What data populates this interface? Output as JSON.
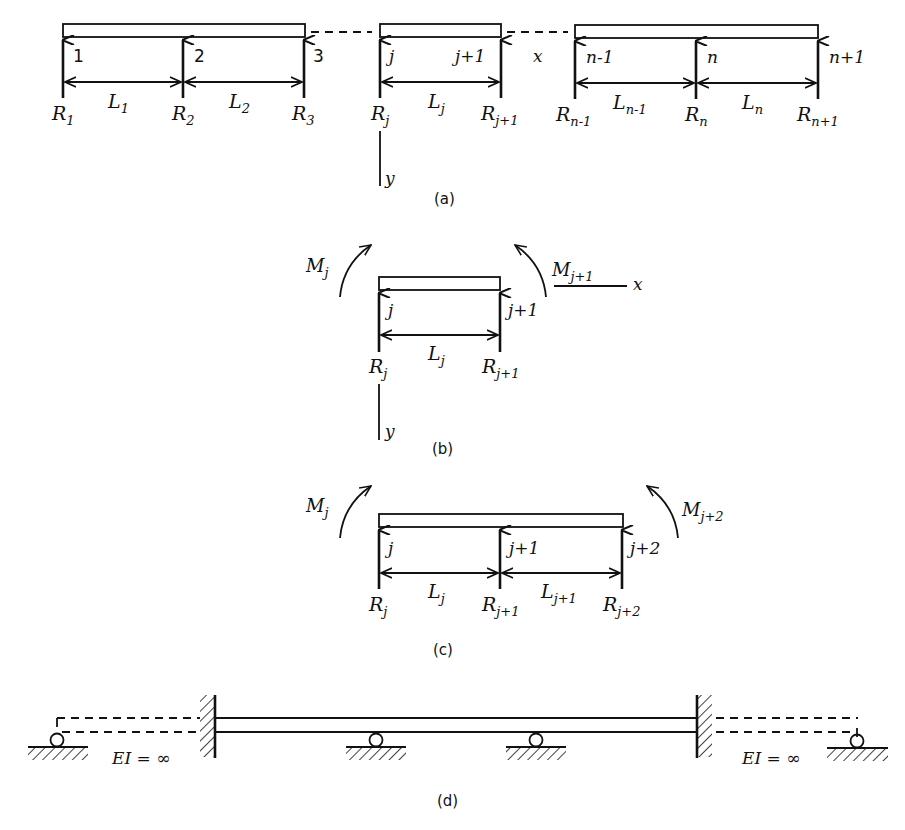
{
  "panels": {
    "a": {
      "caption": "(a)",
      "node_labels": [
        "1",
        "2",
        "3",
        "j",
        "j+1",
        "n-1",
        "n",
        "n+1"
      ],
      "reactions": [
        {
          "base": "R",
          "sub": "1"
        },
        {
          "base": "R",
          "sub": "2"
        },
        {
          "base": "R",
          "sub": "3"
        },
        {
          "base": "R",
          "sub": "j"
        },
        {
          "base": "R",
          "sub": "j+1"
        },
        {
          "base": "R",
          "sub": "n-1"
        },
        {
          "base": "R",
          "sub": "n"
        },
        {
          "base": "R",
          "sub": "n+1"
        }
      ],
      "spans": [
        {
          "base": "L",
          "sub": "1"
        },
        {
          "base": "L",
          "sub": "2"
        },
        {
          "base": "L",
          "sub": "j"
        },
        {
          "base": "L",
          "sub": "n-1"
        },
        {
          "base": "L",
          "sub": "n"
        }
      ],
      "axis_x": "x",
      "axis_y": "y"
    },
    "b": {
      "caption": "(b)",
      "node_labels": [
        "j",
        "j+1"
      ],
      "moments": [
        {
          "base": "M",
          "sub": "j"
        },
        {
          "base": "M",
          "sub": "j+1"
        }
      ],
      "reactions": [
        {
          "base": "R",
          "sub": "j"
        },
        {
          "base": "R",
          "sub": "j+1"
        }
      ],
      "span": {
        "base": "L",
        "sub": "j"
      },
      "axis_x": "x",
      "axis_y": "y"
    },
    "c": {
      "caption": "(c)",
      "node_labels": [
        "j",
        "j+1",
        "j+2"
      ],
      "moments": [
        {
          "base": "M",
          "sub": "j"
        },
        {
          "base": "M",
          "sub": "j+2"
        }
      ],
      "reactions": [
        {
          "base": "R",
          "sub": "j"
        },
        {
          "base": "R",
          "sub": "j+1"
        },
        {
          "base": "R",
          "sub": "j+2"
        }
      ],
      "spans": [
        {
          "base": "L",
          "sub": "j"
        },
        {
          "base": "L",
          "sub": "j+1"
        }
      ]
    },
    "d": {
      "caption": "(d)",
      "rigid_label_left": "EI = ∞",
      "rigid_label_right": "EI = ∞"
    }
  }
}
